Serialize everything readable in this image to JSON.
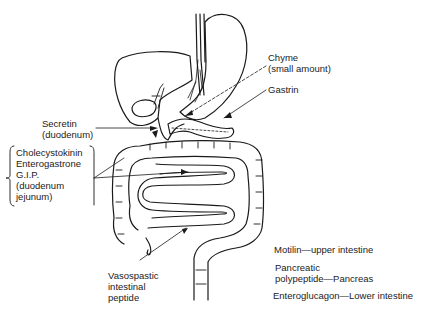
{
  "diagram": {
    "labels": {
      "chyme": {
        "line1": "Chyme",
        "line2": "(small amount)"
      },
      "gastrin": "Gastrin",
      "secretin": {
        "line1": "Secretin",
        "line2": "(duodenum)"
      },
      "cck_group": {
        "line1": "Cholecystokinin",
        "line2": "Enterogastrone",
        "line3": "G.I.P.",
        "line4": "(duodenum",
        "line5": "jejunum)"
      },
      "vip": {
        "line1": "Vasospastic",
        "line2": "intestinal",
        "line3": "peptide"
      },
      "motilin": "Motilin—upper intestine",
      "pancreatic_pp": {
        "line1": "Pancreatic",
        "line2": "polypeptide—Pancreas"
      },
      "enteroglucagon": "Enteroglucagon—Lower intestine"
    },
    "organs": [
      "esophagus",
      "stomach",
      "liver",
      "gallbladder",
      "duodenum",
      "pancreas",
      "small-intestine",
      "large-intestine",
      "rectum"
    ],
    "colors": {
      "line": "#1a1a1a",
      "background": "#ffffff"
    }
  }
}
